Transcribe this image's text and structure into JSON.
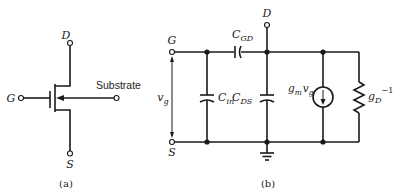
{
  "figure_a": {
    "caption": "(a)",
    "terminals": {
      "drain": "D",
      "gate": "G",
      "source": "S",
      "substrate": "Substrate"
    }
  },
  "figure_b": {
    "caption": "(b)",
    "terminals": {
      "gate": "G",
      "source": "S",
      "drain": "D"
    },
    "components": {
      "gate_voltage": {
        "base": "v",
        "sub": "g"
      },
      "c_gd": {
        "base": "C",
        "sub": "GD"
      },
      "c_in": {
        "base": "C",
        "sub": "in"
      },
      "c_ds": {
        "base": "C",
        "sub": "DS"
      },
      "current_source": {
        "g": "g",
        "g_sub": "m",
        "v": "v",
        "v_sub": "g"
      },
      "output_conductance": {
        "base": "g",
        "sub": "D",
        "sup": "−1"
      }
    }
  },
  "colors": {
    "ink": "#1a1a1a",
    "background": "#ffffff"
  }
}
